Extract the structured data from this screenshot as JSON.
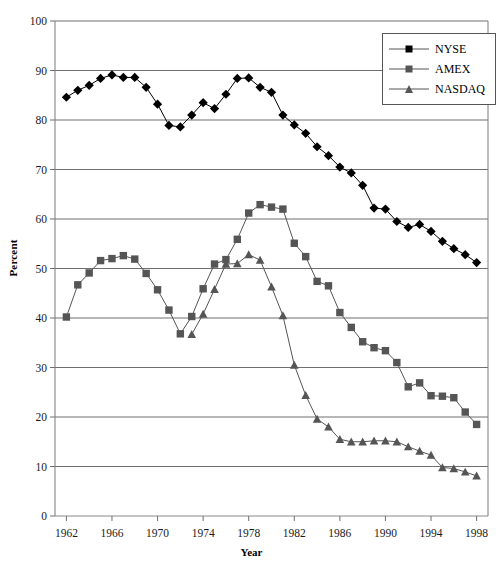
{
  "chart_data": {
    "type": "line",
    "title": "",
    "xlabel": "Year",
    "ylabel": "Percent",
    "xlim": [
      1961,
      1999
    ],
    "ylim": [
      0,
      100
    ],
    "grid": true,
    "legend_position": "top-right",
    "ytick_labels": [
      "100",
      "90",
      "80",
      "70",
      "60",
      "50",
      "40",
      "30",
      "20",
      "10",
      "0"
    ],
    "yticks": [
      100,
      90,
      80,
      70,
      60,
      50,
      40,
      30,
      20,
      10,
      0
    ],
    "xtick_labels": [
      "1962",
      "1966",
      "1970",
      "1974",
      "1978",
      "1982",
      "1986",
      "1990",
      "1994",
      "1998"
    ],
    "xticks": [
      1962,
      1966,
      1970,
      1974,
      1978,
      1982,
      1986,
      1990,
      1994,
      1998
    ],
    "x": [
      1962,
      1963,
      1964,
      1965,
      1966,
      1967,
      1968,
      1969,
      1970,
      1971,
      1972,
      1973,
      1974,
      1975,
      1976,
      1977,
      1978,
      1979,
      1980,
      1981,
      1982,
      1983,
      1984,
      1985,
      1986,
      1987,
      1988,
      1989,
      1990,
      1991,
      1992,
      1993,
      1994,
      1995,
      1996,
      1997,
      1998
    ],
    "series": [
      {
        "name": "NYSE",
        "marker": "diamond",
        "color": "#000000",
        "x": [
          1962,
          1963,
          1964,
          1965,
          1966,
          1967,
          1968,
          1969,
          1970,
          1971,
          1972,
          1973,
          1974,
          1975,
          1976,
          1977,
          1978,
          1979,
          1980,
          1981,
          1982,
          1983,
          1984,
          1985,
          1986,
          1987,
          1988,
          1989,
          1990,
          1991,
          1992,
          1993,
          1994,
          1995,
          1996,
          1997,
          1998
        ],
        "values": [
          84.6,
          86.0,
          87.0,
          88.4,
          89.1,
          88.6,
          88.6,
          86.6,
          83.2,
          78.9,
          78.6,
          81.0,
          83.5,
          82.3,
          85.2,
          88.4,
          88.5,
          86.6,
          85.6,
          81.0,
          79.0,
          77.3,
          74.6,
          72.8,
          70.5,
          69.3,
          66.8,
          62.2,
          62.0,
          59.5,
          58.3,
          58.9,
          57.5,
          55.5,
          54.0,
          52.8,
          51.2
        ]
      },
      {
        "name": "AMEX",
        "marker": "square",
        "color": "#555555",
        "x": [
          1962,
          1963,
          1964,
          1965,
          1966,
          1967,
          1968,
          1969,
          1970,
          1971,
          1972,
          1973,
          1974,
          1975,
          1976,
          1977,
          1978,
          1979,
          1980,
          1981,
          1982,
          1983,
          1984,
          1985,
          1986,
          1987,
          1988,
          1989,
          1990,
          1991,
          1992,
          1993,
          1994,
          1995,
          1996,
          1997,
          1998
        ],
        "values": [
          40.2,
          46.7,
          49.1,
          51.6,
          52.0,
          52.6,
          51.9,
          49.0,
          45.7,
          41.6,
          36.8,
          40.3,
          45.9,
          50.9,
          51.8,
          55.9,
          61.2,
          62.9,
          62.4,
          62.0,
          55.1,
          52.4,
          47.4,
          46.5,
          41.1,
          38.1,
          35.2,
          34.0,
          33.4,
          31.0,
          26.1,
          26.9,
          24.3,
          24.2,
          23.9,
          21.0,
          18.5
        ]
      },
      {
        "name": "NASDAQ",
        "marker": "triangle",
        "color": "#555555",
        "x": [
          1973,
          1974,
          1975,
          1976,
          1977,
          1978,
          1979,
          1980,
          1981,
          1982,
          1983,
          1984,
          1985,
          1986,
          1987,
          1988,
          1989,
          1990,
          1991,
          1992,
          1993,
          1994,
          1995,
          1996,
          1997,
          1998
        ],
        "values": [
          36.7,
          40.8,
          45.8,
          50.9,
          51.0,
          52.8,
          51.7,
          46.3,
          40.5,
          30.5,
          24.4,
          19.6,
          18.0,
          15.5,
          15.0,
          15.0,
          15.2,
          15.2,
          15.0,
          14.0,
          13.1,
          12.3,
          9.8,
          9.6,
          8.9,
          8.1
        ]
      }
    ]
  },
  "legend": {
    "items": [
      {
        "label": "NYSE",
        "marker": "diamond"
      },
      {
        "label": "AMEX",
        "marker": "square"
      },
      {
        "label": "NASDAQ",
        "marker": "triangle"
      }
    ]
  },
  "axes": {
    "y_title": "Percent",
    "x_title": "Year"
  }
}
